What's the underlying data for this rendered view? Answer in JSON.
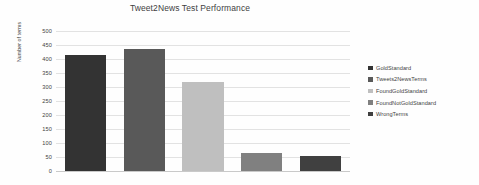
{
  "chart_data": {
    "type": "bar",
    "title": "Tweet2News Test Performance",
    "xlabel": "",
    "ylabel": "Number of terms",
    "categories": [
      "GoldStandard",
      "Tweets2NewsTerms",
      "FoundGoldStandard",
      "FoundNotGoldStandard",
      "WrongTerms"
    ],
    "values": [
      415,
      435,
      317,
      63,
      52
    ],
    "ylim": [
      0,
      500
    ],
    "yticks": [
      0,
      50,
      100,
      150,
      200,
      250,
      300,
      350,
      400,
      450,
      500
    ],
    "ytick_labels": [
      "0",
      "50",
      "100",
      "150",
      "200",
      "250",
      "300",
      "350",
      "400",
      "450",
      "500"
    ],
    "grid": true,
    "legend_position": "right",
    "colors": [
      "#333333",
      "#595959",
      "#bfbfbf",
      "#808080",
      "#404040"
    ],
    "series": [
      {
        "name": "Number of terms",
        "points": [
          {
            "label": "GoldStandard",
            "value": 415,
            "color": "#333333"
          },
          {
            "label": "Tweets2NewsTerms",
            "value": 435,
            "color": "#595959"
          },
          {
            "label": "FoundGoldStandard",
            "value": 317,
            "color": "#bfbfbf"
          },
          {
            "label": "FoundNotGoldStandard",
            "value": 63,
            "color": "#808080"
          },
          {
            "label": "WrongTerms",
            "value": 52,
            "color": "#404040"
          }
        ]
      }
    ]
  },
  "legend": {
    "items": [
      {
        "label": "GoldStandard",
        "color": "#333333"
      },
      {
        "label": "Tweets2NewsTerms",
        "color": "#595959"
      },
      {
        "label": "FoundGoldStandard",
        "color": "#bfbfbf"
      },
      {
        "label": "FoundNotGoldStandard",
        "color": "#808080"
      },
      {
        "label": "WrongTerms",
        "color": "#404040"
      }
    ]
  }
}
